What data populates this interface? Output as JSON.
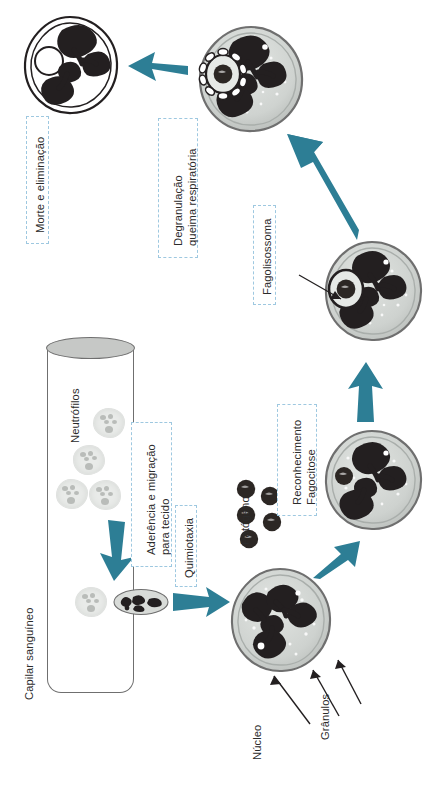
{
  "figure": {
    "language": "pt-BR",
    "orientation": "rotated-90-ccw",
    "accent_color": "#2d7e95",
    "callout_border_color": "#9ec8e0",
    "text_color": "#2b2b2b",
    "cell_fill": "#cfd3d0",
    "nucleus_color": "#231f20",
    "pale_cell_fill": "#e9ebe9",
    "capillary_top_fill": "#c6c8c6"
  },
  "labels": {
    "capilar": "Capilar sanguíneo",
    "neutrofilos": "Neutrófilos",
    "aderencia_line1": "Aderência e migração",
    "aderencia_line2": "para tecido",
    "quimiotaxia": "Quimiotaxia",
    "patogeno": "Patógeno",
    "nucleo": "Núcleo",
    "granulos": "Grânulos",
    "reconhecimento_line1": "Reconhecimento",
    "reconhecimento_line2": "Fagocitose",
    "fagolisossoma": "Fagolisossoma",
    "degranulacao_line1": "Degranulação",
    "degranulacao_line2": "queima respiratória",
    "morte": "Morte e eliminação"
  },
  "steps": [
    {
      "id": "step-aderencia",
      "label": "Aderência e migração para tecido",
      "boxed": true
    },
    {
      "id": "step-quimiotaxia",
      "label": "Quimiotaxia",
      "boxed": true
    },
    {
      "id": "step-reconhecimento",
      "label": "Reconhecimento Fagocitose",
      "boxed": true
    },
    {
      "id": "step-fagolisossoma",
      "label": "Fagolisossoma",
      "boxed": true
    },
    {
      "id": "step-degranulacao",
      "label": "Degranulação queima respiratória",
      "boxed": true
    },
    {
      "id": "step-morte",
      "label": "Morte e eliminação",
      "boxed": true
    }
  ],
  "annotations": [
    {
      "id": "anno-neutrofilos",
      "label": "Neutrófilos"
    },
    {
      "id": "anno-capilar",
      "label": "Capilar sanguíneo"
    },
    {
      "id": "anno-patogeno",
      "label": "Patógeno"
    },
    {
      "id": "anno-nucleo",
      "label": "Núcleo"
    },
    {
      "id": "anno-granulos",
      "label": "Grânulos"
    }
  ],
  "counts": {
    "neutrophils_in_vessel": 5,
    "pathogen_particles": 5,
    "big_cells": 5,
    "teal_arrows": 5
  }
}
